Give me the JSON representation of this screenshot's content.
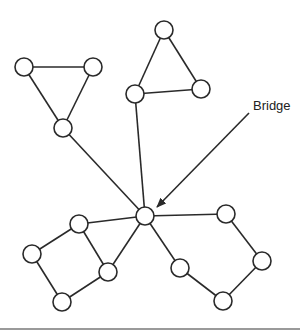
{
  "diagram": {
    "type": "graph",
    "annotation": {
      "label": "Bridge",
      "text_x": 253,
      "text_y": 110,
      "arrow": {
        "x1": 249,
        "y1": 113,
        "x2": 157,
        "y2": 207
      }
    },
    "node_radius": 9,
    "nodes": [
      {
        "id": "t1a",
        "x": 24,
        "y": 67
      },
      {
        "id": "t1b",
        "x": 93,
        "y": 67
      },
      {
        "id": "t1c",
        "x": 63,
        "y": 128
      },
      {
        "id": "t2a",
        "x": 164,
        "y": 30
      },
      {
        "id": "t2b",
        "x": 201,
        "y": 89
      },
      {
        "id": "t2c",
        "x": 135,
        "y": 94
      },
      {
        "id": "hub",
        "x": 145,
        "y": 216
      },
      {
        "id": "l1",
        "x": 79,
        "y": 224
      },
      {
        "id": "l2",
        "x": 32,
        "y": 254
      },
      {
        "id": "l3",
        "x": 108,
        "y": 272
      },
      {
        "id": "l4",
        "x": 62,
        "y": 302
      },
      {
        "id": "r1",
        "x": 226,
        "y": 214
      },
      {
        "id": "r2",
        "x": 262,
        "y": 261
      },
      {
        "id": "r3",
        "x": 180,
        "y": 268
      },
      {
        "id": "r4",
        "x": 223,
        "y": 301
      }
    ],
    "edges": [
      [
        "t1a",
        "t1b"
      ],
      [
        "t1a",
        "t1c"
      ],
      [
        "t1b",
        "t1c"
      ],
      [
        "t2a",
        "t2b"
      ],
      [
        "t2a",
        "t2c"
      ],
      [
        "t2b",
        "t2c"
      ],
      [
        "t1c",
        "hub"
      ],
      [
        "t2c",
        "hub"
      ],
      [
        "hub",
        "l1"
      ],
      [
        "hub",
        "l3"
      ],
      [
        "l1",
        "l2"
      ],
      [
        "l1",
        "l3"
      ],
      [
        "l2",
        "l4"
      ],
      [
        "l3",
        "l4"
      ],
      [
        "hub",
        "r1"
      ],
      [
        "hub",
        "r3"
      ],
      [
        "r1",
        "r2"
      ],
      [
        "r2",
        "r4"
      ],
      [
        "r3",
        "r4"
      ]
    ],
    "colors": {
      "stroke": "#2a2a2a",
      "fill": "#ffffff",
      "rule": "#9a9a9a"
    }
  }
}
